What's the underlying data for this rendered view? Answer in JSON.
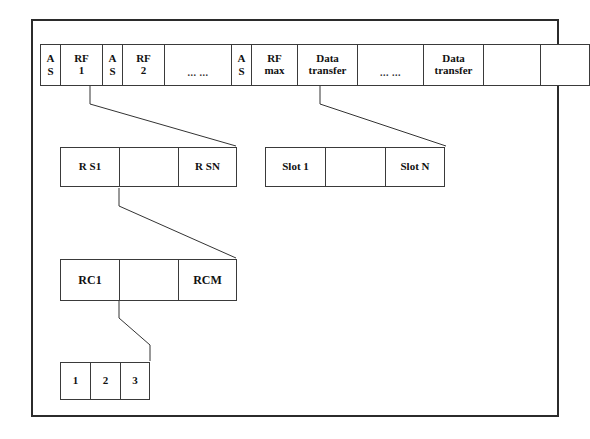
{
  "diagram": {
    "line_color": "#333333",
    "frame_border_color": "#2b2b2b",
    "background": "#ffffff",
    "rows": {
      "frame_row": {
        "name": "frame-timeline",
        "cells": [
          {
            "label": "A\nS",
            "kind": "as"
          },
          {
            "label": "RF\n1",
            "kind": "rf"
          },
          {
            "label": "A\nS",
            "kind": "as"
          },
          {
            "label": "RF\n2",
            "kind": "rf"
          },
          {
            "label": "... ...",
            "kind": "gap"
          },
          {
            "label": "A\nS",
            "kind": "as"
          },
          {
            "label": "RF\nmax",
            "kind": "rfmax"
          },
          {
            "label": "Data\ntransfer",
            "kind": "dt"
          },
          {
            "label": "... ...",
            "kind": "gap2"
          },
          {
            "label": "Data\ntransfer",
            "kind": "dt"
          },
          {
            "label": "",
            "kind": "blank-a"
          },
          {
            "label": "",
            "kind": "blank-b"
          }
        ]
      },
      "rs_row": {
        "name": "reservation-slots",
        "cells": [
          {
            "label": "R S1"
          },
          {
            "label": ""
          },
          {
            "label": "R SN"
          }
        ]
      },
      "slot_row": {
        "name": "data-transfer-slots",
        "cells": [
          {
            "label": "Slot 1"
          },
          {
            "label": ""
          },
          {
            "label": "Slot N"
          }
        ]
      },
      "rc_row": {
        "name": "reservation-cycles",
        "cells": [
          {
            "label": "RC1"
          },
          {
            "label": ""
          },
          {
            "label": "RCM"
          }
        ]
      },
      "mini_row": {
        "name": "mini-slots",
        "cells": [
          {
            "label": "1"
          },
          {
            "label": "2"
          },
          {
            "label": "3"
          }
        ]
      }
    }
  }
}
